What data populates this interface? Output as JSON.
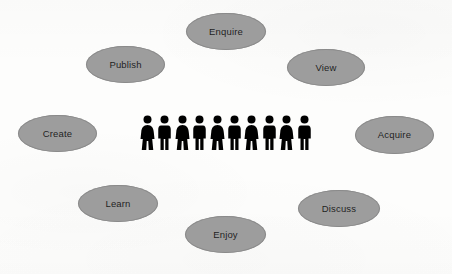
{
  "diagram": {
    "background_color": "#fdfdfc",
    "node_fill_color": "#9d9d9d",
    "node_stroke_color": "#8a8a8a",
    "node_text_color": "#1d1d1d",
    "actor_color": "#000000",
    "nodes": [
      {
        "id": "enquire",
        "label": "Enquire",
        "x": 186,
        "y": 13,
        "w": 80,
        "h": 37
      },
      {
        "id": "publish",
        "label": "Publish",
        "x": 86,
        "y": 46,
        "w": 79,
        "h": 37
      },
      {
        "id": "view",
        "label": "View",
        "x": 287,
        "y": 49,
        "w": 78,
        "h": 37
      },
      {
        "id": "create",
        "label": "Create",
        "x": 18,
        "y": 115,
        "w": 79,
        "h": 37
      },
      {
        "id": "acquire",
        "label": "Acquire",
        "x": 355,
        "y": 116,
        "w": 79,
        "h": 38
      },
      {
        "id": "learn",
        "label": "Learn",
        "x": 78,
        "y": 185,
        "w": 80,
        "h": 37
      },
      {
        "id": "discuss",
        "label": "Discuss",
        "x": 298,
        "y": 190,
        "w": 82,
        "h": 37
      },
      {
        "id": "enjoy",
        "label": "Enjoy",
        "x": 185,
        "y": 216,
        "w": 81,
        "h": 37
      }
    ],
    "actor_group": {
      "name": "people-group",
      "count": 10,
      "x": 140,
      "y": 115,
      "figure_width": 15,
      "figure_height": 40,
      "genders": [
        "female",
        "male",
        "female",
        "male",
        "female",
        "male",
        "female",
        "male",
        "female",
        "male"
      ]
    }
  }
}
